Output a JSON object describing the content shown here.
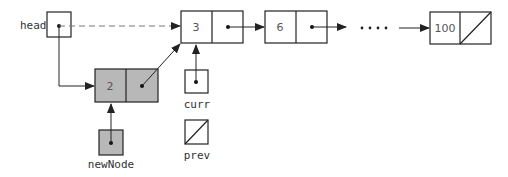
{
  "diagram": {
    "type": "linked-list-insertion",
    "colors": {
      "stroke": "#222222",
      "new_node_fill": "#b8b8b8",
      "background": "#ffffff"
    },
    "pointers": {
      "head": {
        "label": "head"
      },
      "curr": {
        "label": "curr"
      },
      "prev": {
        "label": "prev",
        "value": "null"
      },
      "newNode": {
        "label": "newNode"
      }
    },
    "nodes": [
      {
        "id": "n2",
        "value": "2",
        "highlighted": true
      },
      {
        "id": "n3",
        "value": "3"
      },
      {
        "id": "n6",
        "value": "6"
      },
      {
        "id": "n100",
        "value": "100",
        "next": "null"
      }
    ],
    "ellipsis": "....",
    "edges": [
      {
        "from": "head",
        "to": "n3",
        "style": "dashed"
      },
      {
        "from": "head",
        "to": "n2",
        "style": "solid"
      },
      {
        "from": "n2",
        "to": "n3",
        "style": "solid"
      },
      {
        "from": "n3",
        "to": "n6",
        "style": "solid"
      },
      {
        "from": "n6",
        "to": "ellipsis",
        "style": "solid"
      },
      {
        "from": "ellipsis",
        "to": "n100",
        "style": "solid"
      },
      {
        "from": "curr",
        "to": "n3",
        "style": "solid"
      },
      {
        "from": "newNode",
        "to": "n2",
        "style": "solid"
      }
    ]
  }
}
